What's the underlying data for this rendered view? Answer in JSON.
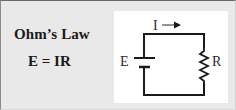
{
  "card": {
    "title": "Ohm’s Law",
    "formula": "E = IR"
  },
  "circuit": {
    "current_label": "I",
    "voltage_label": "E",
    "resistance_label": "R",
    "current_direction": "right",
    "components": [
      "battery",
      "resistor",
      "wire-loop",
      "current-arrow"
    ],
    "colors": {
      "wire": "#1a1a1a",
      "panel_background": "#ffffff",
      "card_background": "#e9e9e9"
    }
  }
}
